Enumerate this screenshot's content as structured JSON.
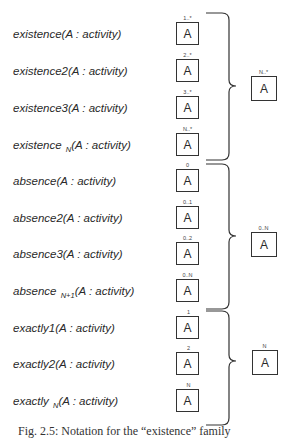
{
  "diagram": {
    "rows": [
      {
        "name": "existence",
        "label": "existence(A : activity)",
        "box_text": "A",
        "cardinality": "1..*"
      },
      {
        "name": "existence2",
        "label": "existence2(A : activity)",
        "box_text": "A",
        "cardinality": "2..*"
      },
      {
        "name": "existence3",
        "label": "existence3(A : activity)",
        "box_text": "A",
        "cardinality": "3..*"
      },
      {
        "name": "existenceN",
        "label_main": "existence ",
        "label_sub": "N",
        "label_rest": "(A : activity)",
        "box_text": "A",
        "cardinality": "N..*"
      },
      {
        "name": "absence",
        "label": "absence(A : activity)",
        "box_text": "A",
        "cardinality": "0"
      },
      {
        "name": "absence2",
        "label": "absence2(A : activity)",
        "box_text": "A",
        "cardinality": "0..1"
      },
      {
        "name": "absence3",
        "label": "absence3(A : activity)",
        "box_text": "A",
        "cardinality": "0..2"
      },
      {
        "name": "absenceN1",
        "label_main": "absence ",
        "label_sub": "N+1",
        "label_rest": "(A : activity)",
        "box_text": "A",
        "cardinality": "0..N"
      },
      {
        "name": "exactly1",
        "label": "exactly1(A : activity)",
        "box_text": "A",
        "cardinality": "1"
      },
      {
        "name": "exactly2",
        "label": "exactly2(A : activity)",
        "box_text": "A",
        "cardinality": "2"
      },
      {
        "name": "exactlyN",
        "label_main": "exactly ",
        "label_sub": "N",
        "label_rest": "(A : activity)",
        "box_text": "A",
        "cardinality": "N"
      }
    ],
    "groups": [
      {
        "name": "existence-family",
        "box_text": "A",
        "cardinality": "N..*"
      },
      {
        "name": "absence-family",
        "box_text": "A",
        "cardinality": "0..N"
      },
      {
        "name": "exactly-family",
        "box_text": "A",
        "cardinality": "N"
      }
    ]
  },
  "caption": "Fig. 2.5: Notation for the “existence” family"
}
